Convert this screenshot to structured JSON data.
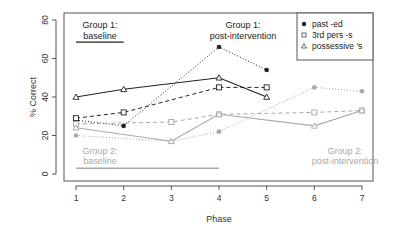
{
  "chart_data": {
    "type": "line",
    "title": "",
    "xlabel": "Phase",
    "ylabel": "% Correct",
    "x": [
      1,
      2,
      3,
      4,
      5,
      6,
      7
    ],
    "xlim": [
      1,
      7
    ],
    "ylim": [
      0,
      80
    ],
    "xticks": [
      "1",
      "2",
      "3",
      "4",
      "5",
      "6",
      "7"
    ],
    "yticks": [
      "0",
      "20",
      "40",
      "60",
      "80"
    ],
    "grid": false,
    "legend_position": "top-right",
    "legend": [
      {
        "label": "past -ed",
        "marker": "filled-circle"
      },
      {
        "label": "3rd pers -s",
        "marker": "open-square"
      },
      {
        "label": "possessive 's",
        "marker": "open-triangle"
      }
    ],
    "groups": [
      {
        "name": "Group 1",
        "color": "#222222",
        "series": [
          {
            "name": "past -ed",
            "line": "dotted",
            "marker": "filled-circle",
            "x": [
              1,
              2,
              4,
              5
            ],
            "values": [
              28,
              25,
              66,
              54
            ]
          },
          {
            "name": "3rd pers -s",
            "line": "dashed",
            "marker": "open-square",
            "x": [
              1,
              2,
              4,
              5
            ],
            "values": [
              29,
              32,
              45,
              45
            ]
          },
          {
            "name": "possessive 's",
            "line": "solid",
            "marker": "open-triangle",
            "x": [
              1,
              2,
              4,
              5
            ],
            "values": [
              40,
              44,
              50,
              40
            ]
          }
        ]
      },
      {
        "name": "Group 2",
        "color": "#a8a8a8",
        "series": [
          {
            "name": "past -ed",
            "line": "dotted",
            "marker": "filled-circle",
            "x": [
              1,
              3,
              4,
              6,
              7
            ],
            "values": [
              20,
              17,
              22,
              45,
              43
            ]
          },
          {
            "name": "3rd pers -s",
            "line": "dashed",
            "marker": "open-square",
            "x": [
              1,
              3,
              4,
              6,
              7
            ],
            "values": [
              26,
              27,
              31,
              32,
              33
            ]
          },
          {
            "name": "possessive 's",
            "line": "solid",
            "marker": "open-triangle",
            "x": [
              1,
              3,
              4,
              6,
              7
            ],
            "values": [
              24,
              17,
              31,
              25,
              33
            ]
          }
        ]
      }
    ],
    "annotations": [
      {
        "text": "Group 1:",
        "text2": "baseline",
        "x": 1.5,
        "y": 76,
        "color": "#222222",
        "underline": {
          "x1": 1,
          "x2": 2,
          "y": 68.5
        }
      },
      {
        "text": "Group 1:",
        "text2": "post-intervention",
        "x": 4.3,
        "y": 76,
        "color": "#222222"
      },
      {
        "text": "Group 2:",
        "text2": "baseline",
        "x": 1.5,
        "y": 11,
        "color": "#a8a8a8",
        "underline": {
          "x1": 1,
          "x2": 4,
          "y": 3
        }
      },
      {
        "text": "Group 2:",
        "text2": "post-intervention",
        "x": 6.9,
        "y": 11,
        "color": "#a8a8a8"
      }
    ]
  },
  "labels": {
    "ylabel": "% Correct",
    "xlabel": "Phase",
    "legend_past": "past -ed",
    "legend_3rd": "3rd pers -s",
    "legend_poss": "possessive 's",
    "g1_base_l1": "Group 1:",
    "g1_base_l2": "baseline",
    "g1_post_l1": "Group 1:",
    "g1_post_l2": "post-intervention",
    "g2_base_l1": "Group 2:",
    "g2_base_l2": "baseline",
    "g2_post_l1": "Group 2:",
    "g2_post_l2": "post-intervention"
  }
}
